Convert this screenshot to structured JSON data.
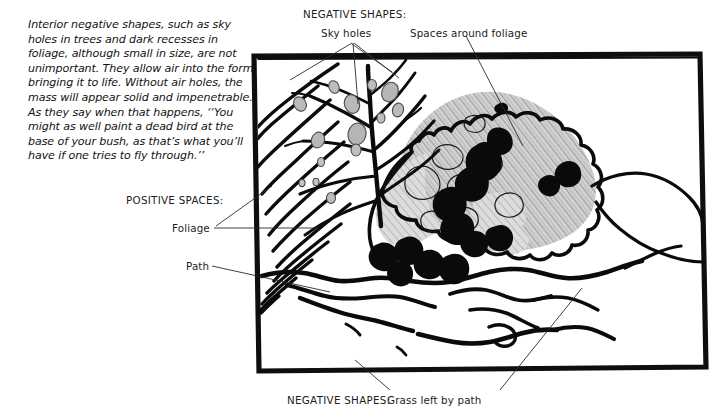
{
  "figure": {
    "caption": "Interior negative shapes, such as sky holes in trees and dark recesses in foliage, although small in size, are not unimportant. They allow air into the form, bringing it to life. Without air holes, the mass will appear solid and impenetrable. As they say when that happens, ‘‘You might as well paint a dead bird at the base of your bush, as that’s what you’ll have if one tries to fly through.’’"
  },
  "annotations": {
    "negative_shapes_top_heading": "NEGATIVE SHAPES:",
    "sky_holes": "Sky holes",
    "spaces_around_foliage": "Spaces around foliage",
    "positive_spaces_heading": "POSITIVE SPACES:",
    "foliage": "Foliage",
    "path": "Path",
    "negative_shapes_bottom_heading": "NEGATIVE SHAPES:",
    "grass_left_by_path": "Grass left by path"
  },
  "colors": {
    "ink": "#111111",
    "leader_line": "#2b2b2b",
    "pencil_gray": "#b2b2b2",
    "pencil_gray_light": "#c9c9c9",
    "paper": "#ffffff"
  },
  "artwork": {
    "description": "Pen and ink landscape drawing inside a hand drawn rectangular frame",
    "frame": {
      "left": 253,
      "top": 54,
      "right": 706,
      "bottom": 371
    },
    "elements": [
      "bare tree with branching limbs at upper left",
      "sky holes as small gray blobs between branches",
      "gray pencil shaded foliage mass at center right",
      "solid black dark recesses within the foliage",
      "winding path across the lower half",
      "grass clumps left along the path"
    ]
  }
}
